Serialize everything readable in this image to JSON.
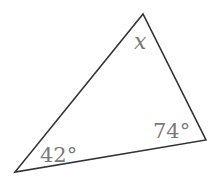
{
  "figure": {
    "type": "triangle",
    "vertices": {
      "top": [
        143,
        14
      ],
      "bottom_left": [
        15,
        172
      ],
      "right": [
        206,
        140
      ]
    },
    "stroke_color": "#333333",
    "label_color": "#7a7a7a",
    "angles": {
      "top": {
        "label": "x"
      },
      "bottom_left": {
        "label": "42°"
      },
      "right": {
        "label": "74°"
      }
    }
  }
}
